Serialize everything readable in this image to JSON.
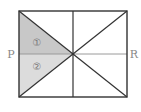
{
  "diagram": {
    "type": "geometry-figure",
    "labels": {
      "left_point": "P",
      "right_point": "R",
      "region_1": "①",
      "region_2": "②"
    },
    "colors": {
      "border": "#333333",
      "midline_pr": "#999999",
      "region_1_fill": "#c8c8c8",
      "region_2_fill": "#dcdcdc",
      "label": "#888888"
    },
    "geometry": {
      "rect": {
        "x1": 19,
        "y1": 11,
        "x2": 127,
        "y2": 97
      },
      "center": {
        "x": 73,
        "y": 54
      }
    }
  }
}
